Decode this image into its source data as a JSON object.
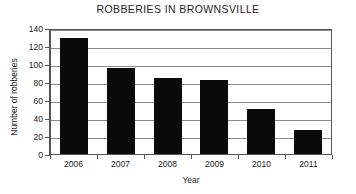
{
  "chart_data": {
    "type": "bar",
    "title": "ROBBERIES IN BROWNSVILLE",
    "xlabel": "Year",
    "ylabel": "Number of robberies",
    "categories": [
      "2006",
      "2007",
      "2008",
      "2009",
      "2010",
      "2011"
    ],
    "values": [
      129,
      96,
      84,
      82,
      50,
      27
    ],
    "ylim": [
      0,
      140
    ],
    "yticks": [
      0,
      20,
      40,
      60,
      80,
      100,
      120,
      140
    ],
    "grid": true,
    "legend": "none",
    "colors": {
      "bar": "#0a0a0a",
      "gridline": "#8c8c8c",
      "axis": "#555555",
      "background": "#ffffff",
      "text": "#1a1a1a"
    }
  }
}
